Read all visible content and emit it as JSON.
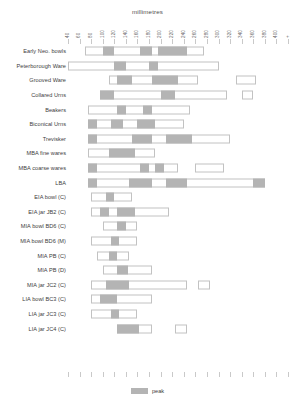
{
  "chart_data": {
    "type": "bar",
    "title": "millimetres",
    "xlabel": "millimetres",
    "ylabel": "",
    "orientation": "horizontal",
    "xlim": [
      40,
      420
    ],
    "grid": false,
    "legend": {
      "position": "bottom",
      "entries": [
        {
          "label": "peak",
          "color": "#b4b4b4"
        }
      ]
    },
    "axis_top_ticks": [
      "40",
      "60",
      "80",
      "100",
      "120",
      "140",
      "160",
      "180",
      "200",
      "220",
      "240",
      "260",
      "280",
      "300",
      "320",
      "340",
      "360",
      "380",
      "400",
      "+"
    ],
    "axis_bottom_ticks": [
      "40",
      "60",
      "80",
      "100",
      "120",
      "140",
      "160",
      "180",
      "200",
      "220",
      "240",
      "260",
      "280",
      "300",
      "320",
      "340",
      "360",
      "380",
      "400",
      "+"
    ],
    "colors": {
      "range_fill": "#ffffff",
      "range_border": "#c2c2c2",
      "peak_fill": "#b4b4b4",
      "tick": "#c9c9c9",
      "text": "#3d3d3d"
    },
    "categories": [
      "Early Neo. bowls",
      "Peterborough Ware",
      "Grooved Ware",
      "Collared Urns",
      "Beakers",
      "Biconical Urns",
      "Trevisker",
      "MBA fine wares",
      "MBA coarse wares",
      "LBA",
      "EIA bowl (C)",
      "EIA jar JB2 (C)",
      "MIA bowl BD6 (C)",
      "MIA bowl BD6 (M)",
      "MIA PB (C)",
      "MIA PB (D)",
      "MIA jar JC2 (C)",
      "LIA bowl BC3 (C)",
      "LIA jar JC3 (C)",
      "LIA jar JC4 (C)"
    ],
    "rows": [
      {
        "label": "Early Neo. bowls",
        "segments": [
          {
            "kind": "range",
            "start": 70,
            "end": 230
          },
          {
            "kind": "peak",
            "start": 100,
            "end": 120
          },
          {
            "kind": "peak",
            "start": 165,
            "end": 185
          },
          {
            "kind": "peak",
            "start": 195,
            "end": 245
          },
          {
            "kind": "range",
            "start": 230,
            "end": 275
          }
        ]
      },
      {
        "label": "Peterborough Ware",
        "segments": [
          {
            "kind": "range",
            "start": 40,
            "end": 300
          },
          {
            "kind": "peak",
            "start": 120,
            "end": 140
          },
          {
            "kind": "peak",
            "start": 180,
            "end": 195
          }
        ]
      },
      {
        "label": "Grooved Ware",
        "segments": [
          {
            "kind": "range",
            "start": 110,
            "end": 265
          },
          {
            "kind": "peak",
            "start": 125,
            "end": 150
          },
          {
            "kind": "peak",
            "start": 185,
            "end": 230
          },
          {
            "kind": "range",
            "start": 330,
            "end": 365
          }
        ]
      },
      {
        "label": "Collared Urns",
        "segments": [
          {
            "kind": "range",
            "start": 95,
            "end": 315
          },
          {
            "kind": "peak",
            "start": 95,
            "end": 120
          },
          {
            "kind": "peak",
            "start": 200,
            "end": 225
          },
          {
            "kind": "range",
            "start": 340,
            "end": 360
          }
        ]
      },
      {
        "label": "Beakers",
        "segments": [
          {
            "kind": "range",
            "start": 75,
            "end": 250
          },
          {
            "kind": "peak",
            "start": 125,
            "end": 140
          },
          {
            "kind": "peak",
            "start": 170,
            "end": 185
          }
        ]
      },
      {
        "label": "Biconical Urns",
        "segments": [
          {
            "kind": "range",
            "start": 75,
            "end": 240
          },
          {
            "kind": "peak",
            "start": 75,
            "end": 90
          },
          {
            "kind": "peak",
            "start": 115,
            "end": 135
          },
          {
            "kind": "peak",
            "start": 160,
            "end": 190
          }
        ]
      },
      {
        "label": "Trevisker",
        "segments": [
          {
            "kind": "range",
            "start": 75,
            "end": 320
          },
          {
            "kind": "peak",
            "start": 75,
            "end": 90
          },
          {
            "kind": "peak",
            "start": 150,
            "end": 185
          },
          {
            "kind": "peak",
            "start": 210,
            "end": 255
          }
        ]
      },
      {
        "label": "MBA fine wares",
        "segments": [
          {
            "kind": "range",
            "start": 75,
            "end": 190
          },
          {
            "kind": "peak",
            "start": 110,
            "end": 155
          }
        ]
      },
      {
        "label": "MBA coarse wares",
        "segments": [
          {
            "kind": "range",
            "start": 75,
            "end": 230
          },
          {
            "kind": "peak",
            "start": 75,
            "end": 90
          },
          {
            "kind": "peak",
            "start": 165,
            "end": 180
          },
          {
            "kind": "peak",
            "start": 190,
            "end": 205
          },
          {
            "kind": "range",
            "start": 260,
            "end": 310
          }
        ]
      },
      {
        "label": "LBA",
        "segments": [
          {
            "kind": "range",
            "start": 75,
            "end": 380
          },
          {
            "kind": "peak",
            "start": 75,
            "end": 90
          },
          {
            "kind": "peak",
            "start": 145,
            "end": 185
          },
          {
            "kind": "peak",
            "start": 210,
            "end": 245
          },
          {
            "kind": "peak",
            "start": 360,
            "end": 380
          }
        ]
      },
      {
        "label": "EIA bowl (C)",
        "segments": [
          {
            "kind": "range",
            "start": 80,
            "end": 150
          },
          {
            "kind": "peak",
            "start": 105,
            "end": 120
          }
        ]
      },
      {
        "label": "EIA jar JB2 (C)",
        "segments": [
          {
            "kind": "range",
            "start": 80,
            "end": 215
          },
          {
            "kind": "peak",
            "start": 95,
            "end": 110
          },
          {
            "kind": "peak",
            "start": 125,
            "end": 155
          }
        ]
      },
      {
        "label": "MIA bowl BD6 (C)",
        "segments": [
          {
            "kind": "range",
            "start": 100,
            "end": 160
          },
          {
            "kind": "peak",
            "start": 125,
            "end": 140
          }
        ]
      },
      {
        "label": "MIA bowl BD6 (M)",
        "segments": [
          {
            "kind": "range",
            "start": 80,
            "end": 160
          },
          {
            "kind": "peak",
            "start": 115,
            "end": 128
          }
        ]
      },
      {
        "label": "MIA PB (C)",
        "segments": [
          {
            "kind": "range",
            "start": 90,
            "end": 145
          },
          {
            "kind": "peak",
            "start": 110,
            "end": 125
          }
        ]
      },
      {
        "label": "MIA PB (D)",
        "segments": [
          {
            "kind": "range",
            "start": 100,
            "end": 185
          },
          {
            "kind": "peak",
            "start": 125,
            "end": 143
          }
        ]
      },
      {
        "label": "MIA jar JC2 (C)",
        "segments": [
          {
            "kind": "range",
            "start": 80,
            "end": 245
          },
          {
            "kind": "peak",
            "start": 105,
            "end": 145
          },
          {
            "kind": "range",
            "start": 265,
            "end": 285
          }
        ]
      },
      {
        "label": "LIA bowl BC3 (C)",
        "segments": [
          {
            "kind": "range",
            "start": 80,
            "end": 185
          },
          {
            "kind": "peak",
            "start": 95,
            "end": 125
          }
        ]
      },
      {
        "label": "LIA jar JC3 (C)",
        "segments": [
          {
            "kind": "range",
            "start": 80,
            "end": 160
          },
          {
            "kind": "peak",
            "start": 115,
            "end": 128
          }
        ]
      },
      {
        "label": "LIA jar JC4 (C)",
        "segments": [
          {
            "kind": "range",
            "start": 125,
            "end": 185
          },
          {
            "kind": "peak",
            "start": 125,
            "end": 163
          },
          {
            "kind": "range",
            "start": 225,
            "end": 245
          }
        ]
      }
    ]
  }
}
